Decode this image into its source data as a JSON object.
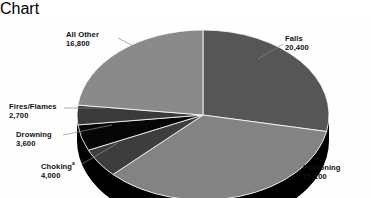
{
  "chart_data": {
    "type": "pie",
    "title": "",
    "subtitle": "",
    "xlabel": "",
    "ylabel": "",
    "legend_position": "callout-labels",
    "grid": false,
    "total": 72600,
    "style": "3d-exploded-none",
    "categories": [
      "Falls",
      "Poisoning",
      "Choking",
      "Drowning",
      "Fires/Flames",
      "All Other"
    ],
    "values": [
      20400,
      25100,
      4000,
      3600,
      2700,
      16800
    ],
    "value_labels": [
      "20,400",
      "25,100",
      "4,000",
      "3,600",
      "2,700",
      "16,800"
    ],
    "percentages": [
      28.1,
      34.6,
      5.5,
      5.0,
      3.7,
      23.1
    ],
    "slice_colors": [
      "#565656",
      "#838383",
      "#3d3d3d",
      "#060606",
      "#3a3a3a",
      "#8a8a8a"
    ],
    "annotations": [
      "Choking label carries a superscript footnote marker"
    ],
    "slices": [
      {
        "name": "Falls",
        "label": "Falls",
        "value": 20400,
        "value_label": "20,400",
        "color": "#565656",
        "start_deg": 0,
        "end_deg": 101.2
      },
      {
        "name": "Poisoning",
        "label": "Poisoning",
        "value": 25100,
        "value_label": "25,100",
        "color": "#838383",
        "start_deg": 101.2,
        "end_deg": 225.6
      },
      {
        "name": "Choking",
        "label": "Choking",
        "value": 4000,
        "value_label": "4,000",
        "color": "#3d3d3d",
        "start_deg": 225.6,
        "end_deg": 245.5,
        "footnote": "a"
      },
      {
        "name": "Drowning",
        "label": "Drowning",
        "value": 3600,
        "value_label": "3,600",
        "color": "#060606",
        "start_deg": 245.5,
        "end_deg": 263.3
      },
      {
        "name": "Fires/Flames",
        "label": "Fires/Flames",
        "value": 2700,
        "value_label": "2,700",
        "color": "#3a3a3a",
        "start_deg": 263.3,
        "end_deg": 276.7
      },
      {
        "name": "All Other",
        "label": "All Other",
        "value": 16800,
        "value_label": "16,800",
        "color": "#8a8a8a",
        "start_deg": 276.7,
        "end_deg": 360.0
      }
    ]
  },
  "labels": {
    "all_other": {
      "name": "All Other",
      "value": "16,800"
    },
    "falls": {
      "name": "Falls",
      "value": "20,400"
    },
    "poisoning": {
      "name": "Poisoning",
      "value": "25,100"
    },
    "fires_flames": {
      "name": "Fires/Flames",
      "value": "2,700"
    },
    "drowning": {
      "name": "Drowning",
      "value": "3,600"
    },
    "choking": {
      "name": "Choking",
      "footnote": "a",
      "value": "4,000"
    }
  },
  "colors": {
    "background": "#ffffff",
    "text": "#111111",
    "leader_line": "#8c8c8c",
    "side_wall": "#000000",
    "light_gray": "#8a8a8a",
    "mid_gray": "#838383",
    "dark_gray": "#565656",
    "black": "#060606"
  }
}
